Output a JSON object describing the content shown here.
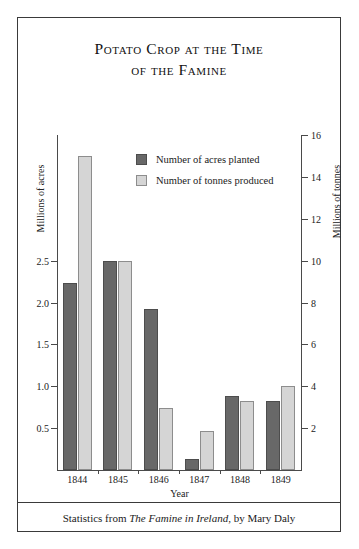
{
  "figure": {
    "title_lines": [
      "Potato Crop at the Time",
      "of the Famine"
    ],
    "caption_prefix": "Statistics from ",
    "caption_book": "The Famine in Ireland",
    "caption_suffix": ", by Mary Daly"
  },
  "legend": {
    "items": [
      {
        "label": "Number of acres planted",
        "swatch": "series-acres",
        "color": "#686868"
      },
      {
        "label": "Number of tonnes produced",
        "swatch": "series-tonnes",
        "color": "#d5d5d5"
      }
    ]
  },
  "chart_data": {
    "type": "bar",
    "title": "Potato Crop at the Time of the Famine",
    "xlabel": "Year",
    "ylabel": "Millions of acres",
    "y2label": "Millions of tonnes",
    "categories": [
      "1844",
      "1845",
      "1846",
      "1847",
      "1848",
      "1849"
    ],
    "series": [
      {
        "name": "Number of acres planted",
        "axis": "left",
        "unit": "millions of acres",
        "color": "#686868",
        "values": [
          2.23,
          2.5,
          1.92,
          0.13,
          0.88,
          0.83
        ]
      },
      {
        "name": "Number of tonnes produced",
        "axis": "right",
        "unit": "millions of tonnes",
        "color": "#d5d5d5",
        "values": [
          15.0,
          10.0,
          2.95,
          1.85,
          3.3,
          4.0
        ]
      }
    ],
    "ylim": [
      0,
      4.0
    ],
    "y2lim": [
      0,
      16
    ],
    "yticks": [
      "0.5",
      "1.0",
      "1.5",
      "2.0",
      "2.5"
    ],
    "ytick_values": [
      0.5,
      1.0,
      1.5,
      2.0,
      2.5
    ],
    "y2ticks": [
      "2",
      "4",
      "6",
      "8",
      "10",
      "12",
      "14",
      "16"
    ],
    "y2tick_values": [
      2,
      4,
      6,
      8,
      10,
      12,
      14,
      16
    ],
    "grid": false,
    "legend_position": "inside-top-center"
  }
}
